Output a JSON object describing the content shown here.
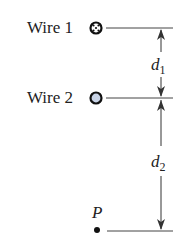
{
  "diagram": {
    "wire1": {
      "label": "Wire 1",
      "symbol": "current-into-page",
      "symbol_fill": "#ffffff"
    },
    "wire2": {
      "label": "Wire 2",
      "symbol": "current-out-of-page",
      "symbol_fill": "#c8d3e6"
    },
    "point": {
      "label": "P"
    },
    "d1": {
      "var": "d",
      "sub": "1"
    },
    "d2": {
      "var": "d",
      "sub": "2"
    },
    "colors": {
      "line": "#333333",
      "text": "#222222"
    }
  }
}
